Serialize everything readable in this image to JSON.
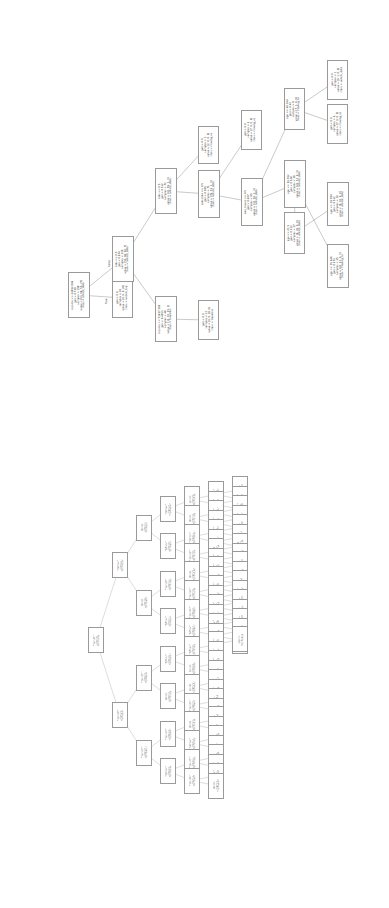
{
  "figure": {
    "title": "",
    "kind": "decision-tree",
    "renderer": "sklearn.tree.plot_tree",
    "orientation": "rotated-90",
    "background": "#ffffff",
    "node_border_color": "#9a9a9a",
    "text_color": "#1a1a1a"
  },
  "edge_labels": {
    "true": "True",
    "false": "False"
  },
  "chart_data": {
    "type": "diagram",
    "title": "",
    "classes": [
      "unlock_data",
      "unlock_top",
      "moving_ns",
      "travelers"
    ],
    "features": [
      "income",
      "kids",
      "subscribe",
      "own_house",
      "age"
    ],
    "trees": [
      {
        "name": "upper-tree",
        "root": "income <= 24952.084",
        "nodes": [
          {
            "id": "u0",
            "tier": "a",
            "x": 68,
            "y": 272,
            "w": 22,
            "h": 46,
            "lines": [
              "income <= 24952.084",
              "gini = 0.739",
              "samples = 198",
              "value = [53, 68, 50, 27]",
              "class = unlock_data"
            ]
          },
          {
            "id": "u1",
            "tier": "a",
            "x": 112,
            "y": 278,
            "w": 21,
            "h": 40,
            "lines": [
              "gini = 0.0",
              "samples = 18",
              "value = [0, 0, 0, 20]",
              "class = unlock_top"
            ]
          },
          {
            "id": "u2",
            "tier": "a",
            "x": 112,
            "y": 236,
            "w": 22,
            "h": 46,
            "lines": [
              "kids <= 0.5",
              "gini = 0.674",
              "samples = 120",
              "value = [53, 68, 50, 7]",
              "class = unlock_data"
            ]
          },
          {
            "id": "u3",
            "tier": "a",
            "x": 155,
            "y": 296,
            "w": 22,
            "h": 46,
            "lines": [
              "income <= 71937.382",
              "gini = 0.4453",
              "samples = 48",
              "value = [12, 10, 25, 1]",
              "class = travelers"
            ]
          },
          {
            "id": "u4",
            "tier": "a",
            "x": 198,
            "y": 300,
            "w": 21,
            "h": 40,
            "lines": [
              "gini = 0.0",
              "samples = 12",
              "value = [0, 0, 18, 0]",
              "class = travelers"
            ]
          },
          {
            "id": "u5",
            "tier": "a",
            "x": 155,
            "y": 168,
            "w": 22,
            "h": 46,
            "lines": [
              "kids <= 0.5",
              "gini = 0.512",
              "samples = 72",
              "value = [41, 59, 1, 3]",
              "class = unlock_data"
            ]
          },
          {
            "id": "u6",
            "tier": "a",
            "x": 198,
            "y": 170,
            "w": 22,
            "h": 48,
            "lines": [
              "subscribe <= 0.5",
              "gini = 0.389",
              "samples = 71",
              "value = [39, 53, 1, 3]",
              "class = unlock_data"
            ]
          },
          {
            "id": "u7",
            "tier": "a",
            "x": 198,
            "y": 126,
            "w": 21,
            "h": 38,
            "lines": [
              "gini = 0.0",
              "samples = 1",
              "value = [2, 0, 0, 0]",
              "class = moving_ns"
            ]
          },
          {
            "id": "u8",
            "tier": "a",
            "x": 241,
            "y": 178,
            "w": 22,
            "h": 48,
            "lines": [
              "own_house <= 0.5",
              "gini = 0.407",
              "samples = 65",
              "value = [32, 56, 1, 3]",
              "class = unlock_data"
            ]
          },
          {
            "id": "u9",
            "tier": "a",
            "x": 241,
            "y": 110,
            "w": 21,
            "h": 40,
            "lines": [
              "gini = 0.0",
              "samples = 4",
              "value = [7, 0, 0, 0]",
              "class = moving_ns"
            ]
          },
          {
            "id": "u10",
            "tier": "a",
            "x": 284,
            "y": 88,
            "w": 21,
            "h": 42,
            "lines": [
              "age <= 40.164",
              "gini = 0.42",
              "samples = 8",
              "value = [7, 1, 0, 0]",
              "class = moving_ns"
            ]
          },
          {
            "id": "u11",
            "tier": "a",
            "x": 284,
            "y": 160,
            "w": 22,
            "h": 48,
            "lines": [
              "age <= 26.762",
              "gini = 0.528",
              "samples = 38",
              "value = [24, 32, 0, 3]",
              "class = unlock_data"
            ]
          },
          {
            "id": "u12",
            "tier": "a",
            "x": 327,
            "y": 60,
            "w": 21,
            "h": 40,
            "lines": [
              "gini = 0.0",
              "samples = 1",
              "value = [0, 1, 0, 0]",
              "class = unlock_data"
            ]
          },
          {
            "id": "u13",
            "tier": "a",
            "x": 327,
            "y": 104,
            "w": 21,
            "h": 40,
            "lines": [
              "gini = 0.0",
              "samples = 6",
              "value = [7, 0, 0, 0]",
              "class = moving_ns"
            ]
          },
          {
            "id": "u14",
            "tier": "a",
            "x": 284,
            "y": 212,
            "w": 21,
            "h": 42,
            "lines": [
              "age <= 21.5",
              "gini = 0.312",
              "samples = 27",
              "value = [6, 26, 0, 0]",
              "class = unlock_data"
            ]
          },
          {
            "id": "u15",
            "tier": "a",
            "x": 327,
            "y": 182,
            "w": 22,
            "h": 44,
            "lines": [
              "age <= 19.784",
              "gini = 0.512",
              "samples = 10",
              "value = [6, 10, 0, 0]",
              "class = unlock_data"
            ]
          },
          {
            "id": "u16",
            "tier": "a",
            "x": 327,
            "y": 244,
            "w": 22,
            "h": 44,
            "lines": [
              "age <= 35.646",
              "gini = 0.273",
              "samples = 25",
              "value = [24, 22, 0, 3]",
              "class = moving_ns"
            ]
          }
        ],
        "edges": [
          [
            "u0",
            "u1"
          ],
          [
            "u0",
            "u2"
          ],
          [
            "u2",
            "u3"
          ],
          [
            "u3",
            "u4"
          ],
          [
            "u2",
            "u5"
          ],
          [
            "u5",
            "u6"
          ],
          [
            "u5",
            "u7"
          ],
          [
            "u6",
            "u8"
          ],
          [
            "u6",
            "u9"
          ],
          [
            "u8",
            "u10"
          ],
          [
            "u8",
            "u11"
          ],
          [
            "u10",
            "u12"
          ],
          [
            "u10",
            "u13"
          ],
          [
            "u11",
            "u14"
          ],
          [
            "u14",
            "u15"
          ],
          [
            "u11",
            "u16"
          ]
        ]
      },
      {
        "name": "lower-tree",
        "root": "income <= 19985.0",
        "node_count": 96
      }
    ]
  },
  "lower_tree_line_template": [
    "income <= 00000.0",
    "gini = 0.000",
    "samples = 00",
    "value = [0, 0, 0, 0]",
    "class = unlock_data"
  ]
}
